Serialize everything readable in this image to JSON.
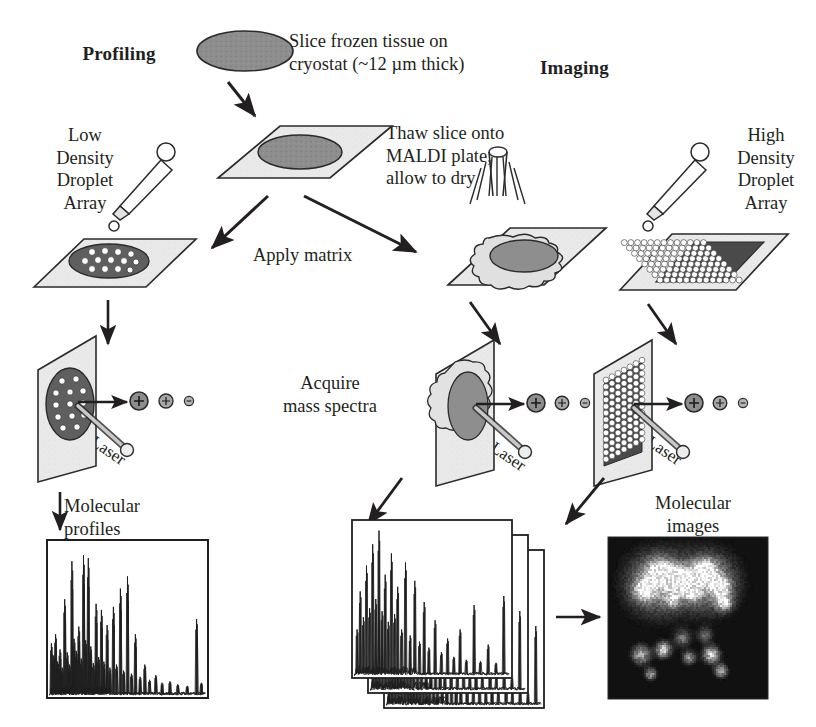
{
  "figure": {
    "headings": {
      "left": "Profiling",
      "right": "Imaging"
    },
    "steps": {
      "slice": "Slice frozen tissue on\ncryostat (~12 µm thick)",
      "thaw": "Thaw slice onto\nMALDI plate,\nallow to dry",
      "apply_matrix": "Apply matrix",
      "acquire": "Acquire\nmass spectra",
      "low_density": "Low\nDensity\nDroplet\nArray",
      "high_density": "High\nDensity\nDroplet\nArray",
      "molecular_profiles": "Molecular\nprofiles",
      "molecular_images": "Molecular\nimages"
    },
    "laser_labels": {
      "left": "Laser",
      "middle": "Laser",
      "right": "Laser"
    },
    "ion_labels": {
      "positive": "+",
      "negative": "−"
    },
    "colors": {
      "ink": "#231f20",
      "plate_fill": "#e8e8e8",
      "plate_edge": "#2b2b2b",
      "tissue_fill": "#8e8e8e",
      "tissue_edge": "#2b2b2b",
      "droplet_fill": "#ffffff",
      "droplet_dark": "#4a4a4a",
      "ion_fill": "#9a9a9a",
      "image_bg": "#111111",
      "background": "#ffffff"
    }
  },
  "chart_data": [
    {
      "type": "line",
      "name": "molecular-profile-spectrum",
      "title": "Molecular profiles",
      "xlabel": "m/z",
      "ylabel": "intensity",
      "grid": false,
      "legend": "none",
      "xlim": [
        0,
        100
      ],
      "ylim": [
        0,
        100
      ],
      "peaks": [
        {
          "x": 1.5,
          "y": 34
        },
        {
          "x": 3.0,
          "y": 26
        },
        {
          "x": 4.2,
          "y": 40
        },
        {
          "x": 5.5,
          "y": 22
        },
        {
          "x": 7.0,
          "y": 30
        },
        {
          "x": 8.4,
          "y": 18
        },
        {
          "x": 10.0,
          "y": 63
        },
        {
          "x": 11.6,
          "y": 28
        },
        {
          "x": 13.0,
          "y": 20
        },
        {
          "x": 14.6,
          "y": 88
        },
        {
          "x": 16.0,
          "y": 37
        },
        {
          "x": 17.4,
          "y": 29
        },
        {
          "x": 19.0,
          "y": 45
        },
        {
          "x": 20.5,
          "y": 24
        },
        {
          "x": 22.0,
          "y": 92
        },
        {
          "x": 23.4,
          "y": 36
        },
        {
          "x": 25.0,
          "y": 90
        },
        {
          "x": 26.6,
          "y": 32
        },
        {
          "x": 28.2,
          "y": 21
        },
        {
          "x": 30.0,
          "y": 60
        },
        {
          "x": 31.6,
          "y": 25
        },
        {
          "x": 33.4,
          "y": 56
        },
        {
          "x": 35.0,
          "y": 22
        },
        {
          "x": 37.0,
          "y": 46
        },
        {
          "x": 38.8,
          "y": 18
        },
        {
          "x": 41.0,
          "y": 58
        },
        {
          "x": 43.0,
          "y": 20
        },
        {
          "x": 45.5,
          "y": 70
        },
        {
          "x": 47.5,
          "y": 16
        },
        {
          "x": 50.0,
          "y": 78
        },
        {
          "x": 52.5,
          "y": 14
        },
        {
          "x": 55.0,
          "y": 40
        },
        {
          "x": 58.0,
          "y": 12
        },
        {
          "x": 61.0,
          "y": 20
        },
        {
          "x": 64.0,
          "y": 10
        },
        {
          "x": 68.0,
          "y": 13
        },
        {
          "x": 72.0,
          "y": 8
        },
        {
          "x": 77.0,
          "y": 9
        },
        {
          "x": 82.0,
          "y": 7
        },
        {
          "x": 88.0,
          "y": 6
        },
        {
          "x": 94.0,
          "y": 50
        },
        {
          "x": 97.0,
          "y": 8
        }
      ]
    },
    {
      "type": "line",
      "name": "imaging-spectra-stack",
      "title": "Stacked mass spectra (imaging)",
      "xlabel": "m/z",
      "ylabel": "intensity",
      "grid": false,
      "legend": "none",
      "stack_count": 3,
      "xlim": [
        0,
        100
      ],
      "ylim": [
        0,
        100
      ],
      "peaks": [
        {
          "x": 2.0,
          "y": 30
        },
        {
          "x": 4.0,
          "y": 55
        },
        {
          "x": 6.0,
          "y": 38
        },
        {
          "x": 8.0,
          "y": 72
        },
        {
          "x": 10.0,
          "y": 44
        },
        {
          "x": 12.0,
          "y": 86
        },
        {
          "x": 14.0,
          "y": 50
        },
        {
          "x": 16.0,
          "y": 95
        },
        {
          "x": 18.0,
          "y": 42
        },
        {
          "x": 20.0,
          "y": 66
        },
        {
          "x": 22.0,
          "y": 35
        },
        {
          "x": 24.0,
          "y": 80
        },
        {
          "x": 26.0,
          "y": 40
        },
        {
          "x": 28.0,
          "y": 58
        },
        {
          "x": 30.5,
          "y": 30
        },
        {
          "x": 33.0,
          "y": 74
        },
        {
          "x": 36.0,
          "y": 26
        },
        {
          "x": 39.0,
          "y": 62
        },
        {
          "x": 42.0,
          "y": 22
        },
        {
          "x": 45.0,
          "y": 48
        },
        {
          "x": 48.0,
          "y": 18
        },
        {
          "x": 52.0,
          "y": 36
        },
        {
          "x": 56.0,
          "y": 15
        },
        {
          "x": 60.0,
          "y": 24
        },
        {
          "x": 64.0,
          "y": 12
        },
        {
          "x": 68.0,
          "y": 30
        },
        {
          "x": 72.0,
          "y": 10
        },
        {
          "x": 77.0,
          "y": 46
        },
        {
          "x": 81.0,
          "y": 9
        },
        {
          "x": 86.0,
          "y": 20
        },
        {
          "x": 91.0,
          "y": 8
        },
        {
          "x": 96.0,
          "y": 52
        }
      ]
    },
    {
      "type": "heatmap",
      "name": "molecular-ion-image",
      "title": "Molecular images",
      "colormap": "grayscale",
      "background": "#111111",
      "description": "Grayscale MALDI ion image of tissue section; two bright lobed regions upper half, scattered bright foci lower half"
    }
  ]
}
